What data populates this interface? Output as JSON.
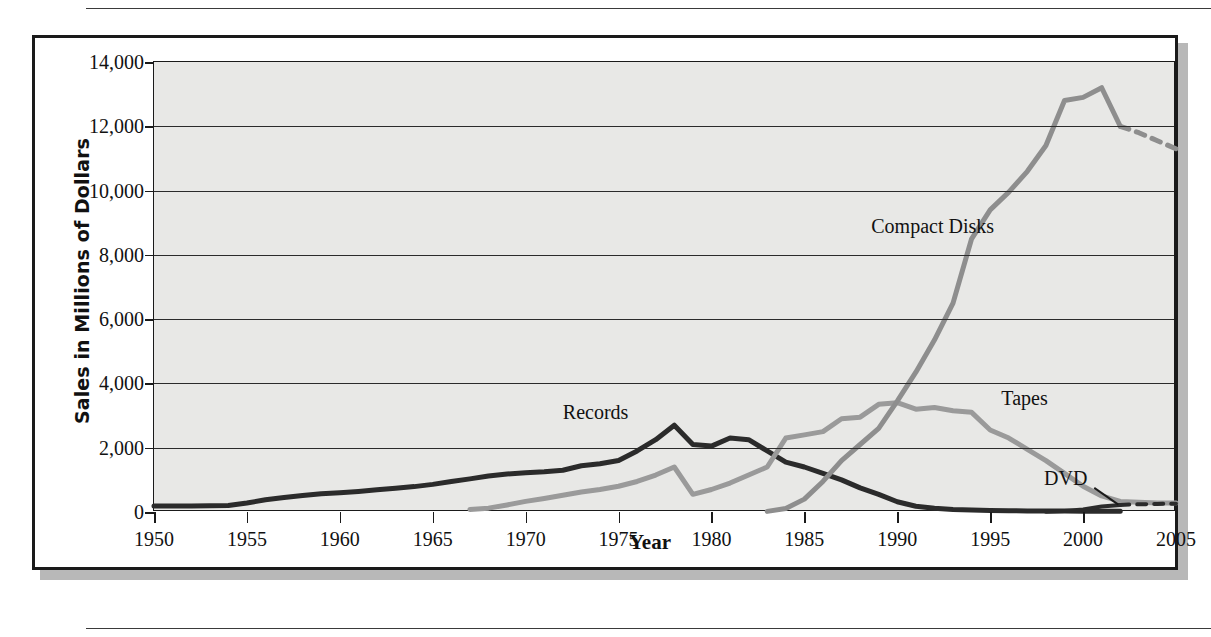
{
  "figure": {
    "xlabel": "Year",
    "ylabel": "Sales in Millions of Dollars"
  },
  "colors": {
    "records": "#2b2b2b",
    "tapes": "#9a9a9a",
    "compact_disks": "#8e8e8e",
    "dvd": "#2b2b2b",
    "plot_background": "#e8e8e6",
    "gridline": "#2b2b2b",
    "frame": "#1a1a1a",
    "shadow": "#b8b8b8"
  },
  "axes": {
    "y_ticks": [
      "0",
      "2,000",
      "4,000",
      "6,000",
      "8,000",
      "10,000",
      "12,000",
      "14,000"
    ],
    "y_tick_values": [
      0,
      2000,
      4000,
      6000,
      8000,
      10000,
      12000,
      14000
    ],
    "x_ticks": [
      "1950",
      "1955",
      "1960",
      "1965",
      "1970",
      "1975",
      "1980",
      "1985",
      "1990",
      "1995",
      "2000",
      "2005"
    ],
    "x_tick_values": [
      1950,
      1955,
      1960,
      1965,
      1970,
      1975,
      1980,
      1985,
      1990,
      1995,
      2000,
      2005
    ]
  },
  "annotations": [
    {
      "name": "records",
      "label": "Records"
    },
    {
      "name": "compact-disks",
      "label": "Compact Disks"
    },
    {
      "name": "tapes",
      "label": "Tapes"
    },
    {
      "name": "dvd",
      "label": "DVD"
    }
  ],
  "chart_data": {
    "type": "line",
    "title": "",
    "subtitle": "",
    "xlabel": "Year",
    "ylabel": "Sales in Millions of Dollars",
    "xlim": [
      1950,
      2005
    ],
    "ylim": [
      0,
      14000
    ],
    "grid": true,
    "grid_axis": "y",
    "legend_position": "inline-annotations",
    "series": [
      {
        "name": "Records",
        "color": "#2b2b2b",
        "style": "solid",
        "points": [
          [
            1950,
            190
          ],
          [
            1951,
            190
          ],
          [
            1952,
            190
          ],
          [
            1953,
            195
          ],
          [
            1954,
            200
          ],
          [
            1955,
            280
          ],
          [
            1956,
            380
          ],
          [
            1957,
            450
          ],
          [
            1958,
            510
          ],
          [
            1959,
            570
          ],
          [
            1960,
            600
          ],
          [
            1961,
            640
          ],
          [
            1962,
            690
          ],
          [
            1963,
            740
          ],
          [
            1964,
            790
          ],
          [
            1965,
            860
          ],
          [
            1966,
            950
          ],
          [
            1967,
            1030
          ],
          [
            1968,
            1120
          ],
          [
            1969,
            1180
          ],
          [
            1970,
            1220
          ],
          [
            1971,
            1250
          ],
          [
            1972,
            1300
          ],
          [
            1973,
            1440
          ],
          [
            1974,
            1500
          ],
          [
            1975,
            1600
          ],
          [
            1976,
            1900
          ],
          [
            1977,
            2250
          ],
          [
            1978,
            2700
          ],
          [
            1979,
            2100
          ],
          [
            1980,
            2050
          ],
          [
            1981,
            2300
          ],
          [
            1982,
            2250
          ],
          [
            1983,
            1900
          ],
          [
            1984,
            1550
          ],
          [
            1985,
            1400
          ],
          [
            1986,
            1200
          ],
          [
            1987,
            1000
          ],
          [
            1988,
            750
          ],
          [
            1989,
            550
          ],
          [
            1990,
            320
          ],
          [
            1991,
            180
          ],
          [
            1992,
            120
          ],
          [
            1993,
            80
          ],
          [
            1994,
            60
          ],
          [
            1995,
            50
          ],
          [
            1996,
            40
          ],
          [
            1997,
            35
          ],
          [
            1998,
            30
          ],
          [
            1999,
            28
          ],
          [
            2000,
            26
          ],
          [
            2001,
            25
          ],
          [
            2002,
            25
          ]
        ]
      },
      {
        "name": "Tapes",
        "color": "#9a9a9a",
        "style": "solid",
        "points": [
          [
            1967,
            80
          ],
          [
            1968,
            120
          ],
          [
            1969,
            220
          ],
          [
            1970,
            330
          ],
          [
            1971,
            420
          ],
          [
            1972,
            520
          ],
          [
            1973,
            620
          ],
          [
            1974,
            700
          ],
          [
            1975,
            800
          ],
          [
            1976,
            950
          ],
          [
            1977,
            1150
          ],
          [
            1978,
            1400
          ],
          [
            1979,
            550
          ],
          [
            1980,
            700
          ],
          [
            1981,
            900
          ],
          [
            1982,
            1150
          ],
          [
            1983,
            1400
          ],
          [
            1984,
            2300
          ],
          [
            1985,
            2400
          ],
          [
            1986,
            2500
          ],
          [
            1987,
            2900
          ],
          [
            1988,
            2950
          ],
          [
            1989,
            3350
          ],
          [
            1990,
            3400
          ],
          [
            1991,
            3200
          ],
          [
            1992,
            3250
          ],
          [
            1993,
            3150
          ],
          [
            1994,
            3100
          ],
          [
            1995,
            2550
          ],
          [
            1996,
            2300
          ],
          [
            1997,
            1950
          ],
          [
            1998,
            1600
          ],
          [
            1999,
            1200
          ],
          [
            2000,
            800
          ],
          [
            2001,
            500
          ],
          [
            2002,
            330
          ],
          [
            2003,
            300
          ],
          [
            2004,
            280
          ],
          [
            2005,
            280
          ]
        ]
      },
      {
        "name": "Compact Disks",
        "color": "#8e8e8e",
        "style": "solid",
        "points": [
          [
            1983,
            20
          ],
          [
            1984,
            110
          ],
          [
            1985,
            400
          ],
          [
            1986,
            950
          ],
          [
            1987,
            1600
          ],
          [
            1988,
            2100
          ],
          [
            1989,
            2600
          ],
          [
            1990,
            3450
          ],
          [
            1991,
            4350
          ],
          [
            1992,
            5350
          ],
          [
            1993,
            6500
          ],
          [
            1994,
            8500
          ],
          [
            1995,
            9400
          ],
          [
            1996,
            9950
          ],
          [
            1997,
            10600
          ],
          [
            1998,
            11400
          ],
          [
            1999,
            12800
          ],
          [
            2000,
            12900
          ],
          [
            2001,
            13200
          ],
          [
            2002,
            12000
          ]
        ]
      },
      {
        "name": "Compact Disks (projected)",
        "color": "#8e8e8e",
        "style": "dashed",
        "points": [
          [
            2002,
            12000
          ],
          [
            2003,
            11800
          ],
          [
            2004,
            11550
          ],
          [
            2005,
            11300
          ]
        ]
      },
      {
        "name": "DVD",
        "color": "#2b2b2b",
        "style": "solid",
        "points": [
          [
            1998,
            10
          ],
          [
            1999,
            30
          ],
          [
            2000,
            80
          ],
          [
            2001,
            170
          ],
          [
            2002,
            220
          ]
        ]
      },
      {
        "name": "DVD (projected)",
        "color": "#2b2b2b",
        "style": "dashed",
        "points": [
          [
            2002,
            220
          ],
          [
            2003,
            240
          ],
          [
            2004,
            250
          ],
          [
            2005,
            260
          ]
        ]
      }
    ]
  }
}
